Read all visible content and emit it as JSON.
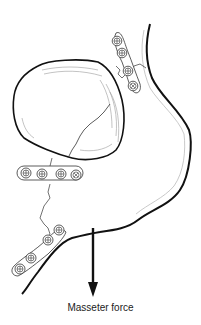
{
  "figure": {
    "type": "medical-illustration",
    "annotation": {
      "label": "Masseter force",
      "arrow_direction": "down"
    },
    "elements": {
      "tooth": "impacted molar",
      "plates": [
        {
          "name": "upper-ramus-plate",
          "holes": 4
        },
        {
          "name": "middle-plate",
          "holes": 4
        },
        {
          "name": "inferior-border-plate",
          "holes": 4
        }
      ]
    },
    "colors": {
      "line": "#111111",
      "shading": "#9a9a9a",
      "background": "#ffffff"
    }
  }
}
